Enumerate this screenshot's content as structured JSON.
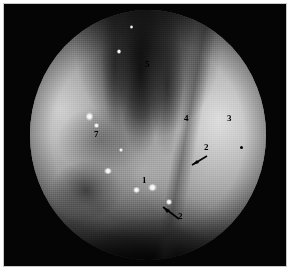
{
  "figure": {
    "kind": "endoscopic-photograph",
    "modality": "flexible laryngoscopy / pharyngoscopy",
    "palette": "grayscale",
    "background_color": "#ffffff",
    "plate_color": "#050505",
    "annotation_color": "#000000",
    "highlight_color": "#ffffff"
  },
  "annotations": [
    {
      "id": "label-5",
      "text": "5",
      "x": 145,
      "y": 64
    },
    {
      "id": "label-7",
      "text": "7",
      "x": 94,
      "y": 134
    },
    {
      "id": "label-4",
      "text": "4",
      "x": 184,
      "y": 118
    },
    {
      "id": "label-3",
      "text": "3",
      "x": 227,
      "y": 118
    },
    {
      "id": "label-2-upper",
      "text": "2",
      "x": 204,
      "y": 147
    },
    {
      "id": "label-1",
      "text": "1",
      "x": 142,
      "y": 180
    },
    {
      "id": "label-2-lower",
      "text": "2",
      "x": 178,
      "y": 216
    }
  ],
  "markers": [
    {
      "id": "dot-marker-right",
      "x": 240,
      "y": 146
    }
  ],
  "arrows": [
    {
      "id": "arrow-upper-2",
      "from_x": 203,
      "from_y": 152,
      "to_x": 186,
      "to_y": 161
    },
    {
      "id": "arrow-lower-2",
      "from_x": 175,
      "from_y": 215,
      "to_x": 159,
      "to_y": 203
    }
  ],
  "highlights": [
    {
      "id": "highlight-a",
      "x": 90,
      "y": 116,
      "w": 7,
      "h": 9
    },
    {
      "id": "highlight-b",
      "x": 97,
      "y": 126,
      "w": 5,
      "h": 5
    },
    {
      "id": "highlight-c",
      "x": 107,
      "y": 171,
      "w": 8,
      "h": 6
    },
    {
      "id": "highlight-d",
      "x": 136,
      "y": 190,
      "w": 7,
      "h": 6
    },
    {
      "id": "highlight-e",
      "x": 151,
      "y": 187,
      "w": 9,
      "h": 7
    },
    {
      "id": "highlight-f",
      "x": 169,
      "y": 202,
      "w": 6,
      "h": 6
    },
    {
      "id": "highlight-g",
      "x": 120,
      "y": 52,
      "w": 4,
      "h": 5
    },
    {
      "id": "highlight-h",
      "x": 122,
      "y": 151,
      "w": 4,
      "h": 4
    },
    {
      "id": "highlight-i",
      "x": 133,
      "y": 28,
      "w": 3,
      "h": 4
    }
  ]
}
